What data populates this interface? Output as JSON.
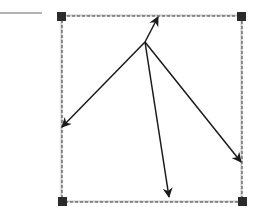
{
  "diagram": {
    "type": "vector-diagram",
    "background": "#ffffff",
    "stroke_color": "#1a1a1a",
    "frame": {
      "x": 62,
      "y": 16,
      "width": 180,
      "height": 186,
      "outer_border_color": "#c8c8c8",
      "dash_color": "#444444"
    },
    "handles": [
      {
        "name": "top-left",
        "x": 57,
        "y": 12,
        "size": 9,
        "color": "#2b2b2b"
      },
      {
        "name": "top-right",
        "x": 237,
        "y": 12,
        "size": 9,
        "color": "#2b2b2b"
      },
      {
        "name": "bottom-left",
        "x": 58,
        "y": 197,
        "size": 9,
        "color": "#2b2b2b"
      },
      {
        "name": "bottom-right",
        "x": 238,
        "y": 197,
        "size": 9,
        "color": "#2b2b2b"
      }
    ],
    "separator_line": {
      "x1": 0,
      "y1": 13,
      "x2": 42,
      "y2": 13,
      "color": "#666666"
    },
    "origin": {
      "x": 145,
      "y": 42
    },
    "arrows": [
      {
        "name": "up",
        "to": {
          "x": 158,
          "y": 17
        }
      },
      {
        "name": "left",
        "to": {
          "x": 62,
          "y": 127
        }
      },
      {
        "name": "down",
        "to": {
          "x": 169,
          "y": 197
        }
      },
      {
        "name": "right",
        "to": {
          "x": 241,
          "y": 162
        }
      }
    ]
  }
}
